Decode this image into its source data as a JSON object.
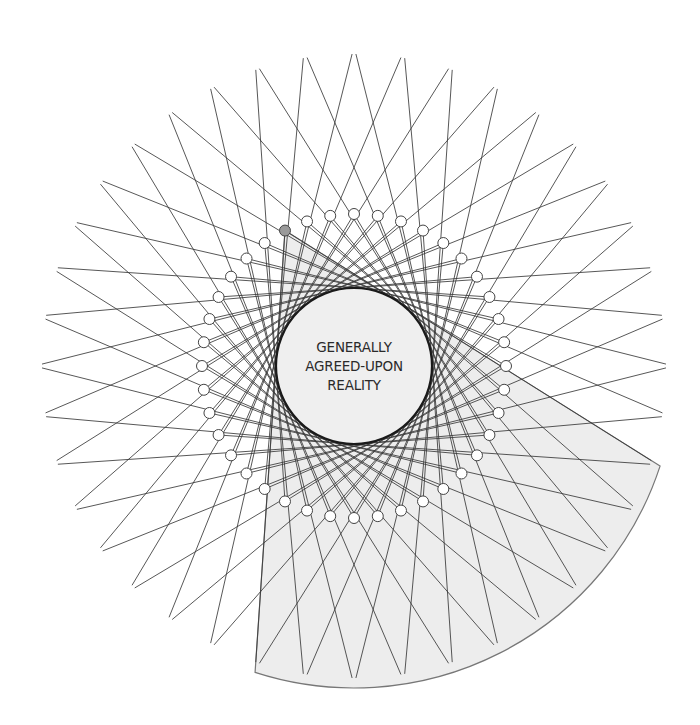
{
  "diagram": {
    "title_lines": [
      "GENERALLY",
      "AGREED-UPON",
      "REALITY"
    ],
    "geometry": {
      "center": [
        354,
        366
      ],
      "inner_radius": 78,
      "ring_radius": 152,
      "ring_count": 40,
      "ring_start_angle_deg": -90,
      "node_radius": 5.5,
      "outer_radius": 312,
      "highlight_node_index": 37,
      "wedge_outer_radius": 322
    },
    "colors": {
      "background": "#ffffff",
      "line": "#3a3a3a",
      "inner_fill": "#efefef",
      "inner_stroke": "#1a1a1a",
      "node_fill": "#ffffff",
      "node_stroke": "#444444",
      "highlight_node_fill": "#9a9a9a",
      "wedge_fill": "#ededed",
      "wedge_stroke": "#777777"
    }
  }
}
